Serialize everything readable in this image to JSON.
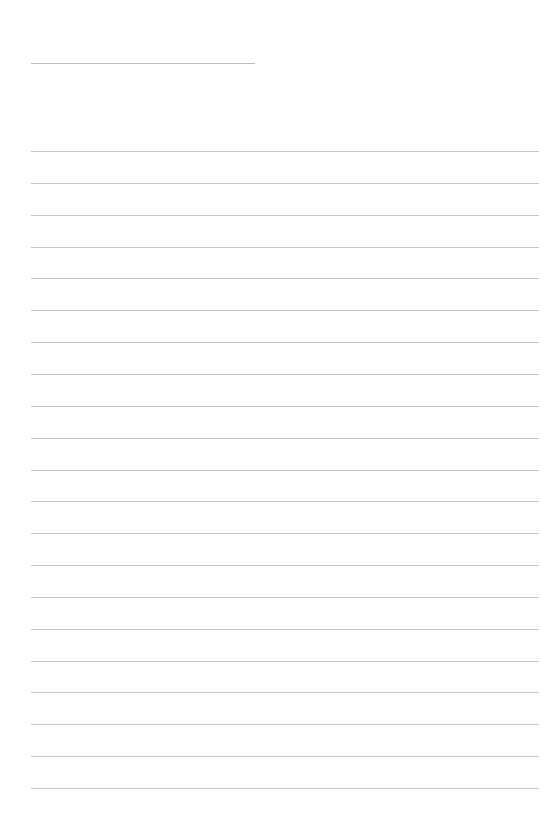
{
  "page": {
    "type": "blank lined writing paper",
    "title_line": {
      "x": 31,
      "y": 63,
      "width": 224
    },
    "rules": {
      "count": 21,
      "first_y": 151,
      "spacing": 31.85,
      "x": 31,
      "width": 508
    },
    "colors": {
      "background": "#fefefe",
      "title_line": "#bdbdbd",
      "rule": "#c6c6c6"
    }
  }
}
